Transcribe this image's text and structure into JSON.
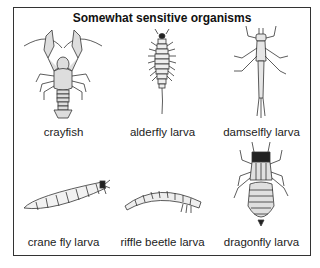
{
  "title": "Somewhat sensitive organisms",
  "organisms": [
    {
      "name": "crayfish",
      "icon": "crayfish-icon"
    },
    {
      "name": "alderfly larva",
      "icon": "alderfly-larva-icon"
    },
    {
      "name": "damselfly larva",
      "icon": "damselfly-larva-icon"
    },
    {
      "name": "crane fly larva",
      "icon": "crane-fly-larva-icon"
    },
    {
      "name": "riffle beetle larva",
      "icon": "riffle-beetle-larva-icon"
    },
    {
      "name": "dragonfly larva",
      "icon": "dragonfly-larva-icon"
    }
  ],
  "colors": {
    "border": "#333333",
    "fill": "#e2e2e2",
    "stroke": "#333333"
  }
}
